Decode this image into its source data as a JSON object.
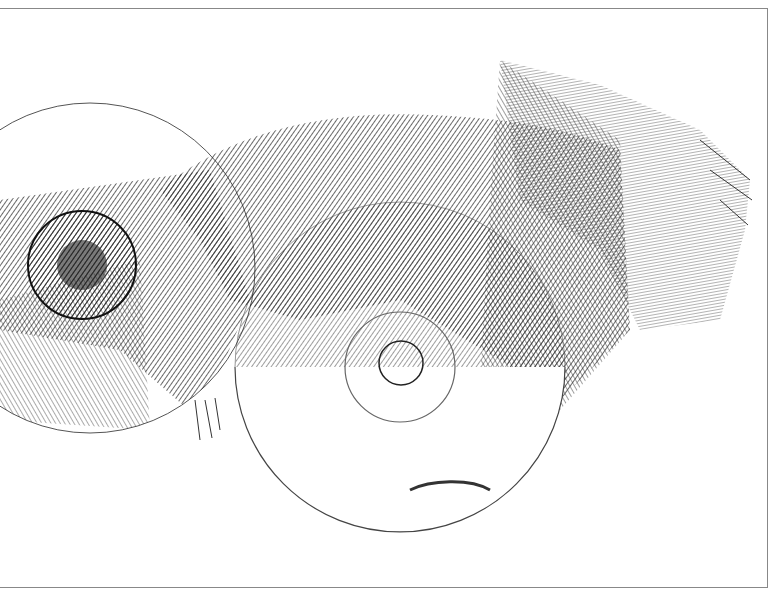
{
  "artwork": {
    "description": "Monochrome engraving-style print of two compact discs partially wrapped in crumpled hatched fabric",
    "colors": {
      "ink": "#1a1a1a",
      "paper": "#ffffff",
      "frame": "#888888"
    },
    "objects": [
      {
        "name": "left-disc",
        "cx": 90,
        "cy": 268,
        "r": 165
      },
      {
        "name": "center-disc",
        "cx": 400,
        "cy": 367,
        "r": 165
      },
      {
        "name": "fabric-drape",
        "region": "center-right band across both discs"
      }
    ]
  }
}
